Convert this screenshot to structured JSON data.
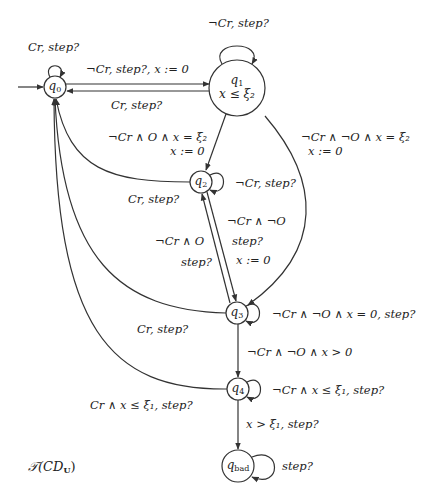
{
  "diagram": {
    "title_display": "𝒯(CD",
    "title_sub": "U",
    "nodes": [
      {
        "id": "q0",
        "label": "q",
        "sub": "0",
        "initial": true
      },
      {
        "id": "q1",
        "label": "q",
        "sub": "1",
        "invariant": "x ≤ ξ₂"
      },
      {
        "id": "q2",
        "label": "q",
        "sub": "2"
      },
      {
        "id": "q3",
        "label": "q",
        "sub": "3"
      },
      {
        "id": "q4",
        "label": "q",
        "sub": "4"
      },
      {
        "id": "qbad",
        "label": "q",
        "sub": "bad"
      }
    ],
    "edges": [
      {
        "from": "q0",
        "to": "q0",
        "label": "Cr, step?"
      },
      {
        "from": "q0",
        "to": "q1",
        "label": "¬Cr, step?, x := 0"
      },
      {
        "from": "q1",
        "to": "q0",
        "label": "Cr, step?"
      },
      {
        "from": "q1",
        "to": "q1",
        "label": "¬Cr, step?"
      },
      {
        "from": "q1",
        "to": "q2",
        "label": "¬Cr ∧ O ∧ x = ξ₂",
        "label2": "x := 0"
      },
      {
        "from": "q1",
        "to": "q3",
        "label": "¬Cr ∧ ¬O ∧ x = ξ₂",
        "label2": "x := 0"
      },
      {
        "from": "q2",
        "to": "q0",
        "label": "Cr, step?"
      },
      {
        "from": "q2",
        "to": "q2",
        "label": "¬Cr, step?"
      },
      {
        "from": "q2",
        "to": "q3",
        "label": "¬Cr ∧ ¬O",
        "label2": "step?",
        "label3": "x := 0"
      },
      {
        "from": "q3",
        "to": "q2",
        "label": "¬Cr ∧ O",
        "label2": "step?"
      },
      {
        "from": "q3",
        "to": "q0",
        "label": "Cr, step?"
      },
      {
        "from": "q3",
        "to": "q3",
        "label": "¬Cr ∧ ¬O ∧ x = 0, step?"
      },
      {
        "from": "q3",
        "to": "q4",
        "label": "¬Cr ∧ ¬O ∧ x > 0"
      },
      {
        "from": "q4",
        "to": "q0",
        "label": "Cr ∧ x ≤ ξ₁, step?"
      },
      {
        "from": "q4",
        "to": "q4",
        "label": "¬Cr ∧ x ≤ ξ₁, step?"
      },
      {
        "from": "q4",
        "to": "qbad",
        "label": "x > ξ₁, step?"
      },
      {
        "from": "qbad",
        "to": "qbad",
        "label": "step?"
      }
    ]
  }
}
